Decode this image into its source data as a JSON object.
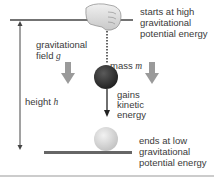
{
  "labels": {
    "start": [
      "starts at high",
      "gravitational",
      "potential energy"
    ],
    "field": [
      "gravitational",
      "field"
    ],
    "field_symbol": "g",
    "mass": "mass",
    "mass_symbol": "m",
    "gains": [
      "gains",
      "kinetic",
      "energy"
    ],
    "height": "height",
    "height_symbol": "h",
    "end": [
      "ends at low",
      "gravitational",
      "potential energy"
    ]
  },
  "colors": {
    "line": "#444444",
    "ground": "#666666",
    "field_arrow": "#999999",
    "mass_dark": "#333333",
    "mass_light": "#d8d8d8"
  }
}
